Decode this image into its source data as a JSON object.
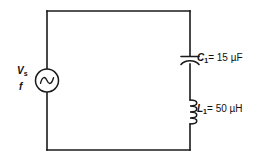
{
  "diagram": {
    "type": "schematic",
    "stroke_color": "#1a1a1a",
    "background_color": "#ffffff",
    "source": {
      "icon": "ac-voltage-source-icon",
      "voltage_symbol": "V",
      "voltage_subscript": "s",
      "frequency_symbol": "f"
    },
    "components": [
      {
        "icon": "capacitor-icon",
        "designator": "C",
        "subscript": "1",
        "equals": "=",
        "value": "15",
        "unit": "µF",
        "label": "C₁ = 15 µF"
      },
      {
        "icon": "inductor-icon",
        "designator": "L",
        "subscript": "1",
        "equals": "=",
        "value": "50",
        "unit": "µH",
        "label": "L₁ = 50 µH"
      }
    ]
  },
  "labels": {
    "capacitor_value_text": "= 15 µF",
    "inductor_value_text": "= 50 µH"
  }
}
